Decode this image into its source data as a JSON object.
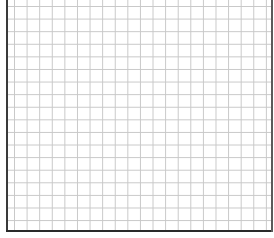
{
  "chart_data": {
    "type": "scatter",
    "title": "",
    "xlabel": "",
    "ylabel": "",
    "series": [],
    "x": [],
    "values": [],
    "grid": true,
    "grid_spacing_px": 12.6,
    "grid_color": "#c8c8c8",
    "axis_color": "#2a2a2a",
    "background_color": "#ffffff",
    "legend": null,
    "tick_labels": {
      "x": [],
      "y": []
    },
    "note": "Empty plot area: blank square grid with left, bottom and right frame lines; no data, labels or ticks visible"
  }
}
